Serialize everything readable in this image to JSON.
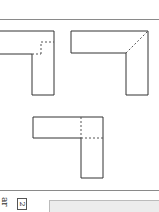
{
  "page": {
    "type": "scanned book page (rotated)",
    "rule_color": "#8a8a8a"
  },
  "figures": {
    "shape_a": {
      "label": "L-shape with dashed square joint",
      "stroke": "#333333"
    },
    "shape_b": {
      "label": "L-shape with dashed diagonal (mitered) joint",
      "stroke": "#333333"
    },
    "shape_c": {
      "label": "L-shape with dashed cross-lap joint",
      "stroke": "#333333"
    }
  },
  "footer": {
    "text_fragment": "ar",
    "boxed_number": "2"
  }
}
